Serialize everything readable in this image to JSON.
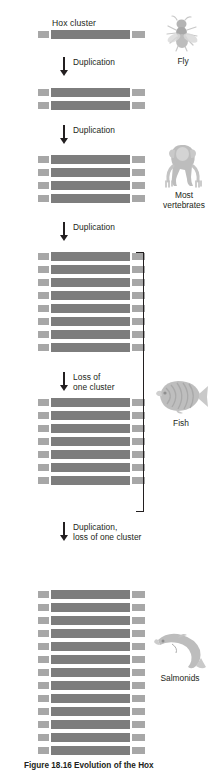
{
  "figure": {
    "title": "Hox cluster",
    "caption": "Figure 18.16  Evolution of the Hox",
    "bar_color": "#7d7d7d",
    "cap_color": "#a7a7a7",
    "ink_color": "#231f20"
  },
  "transitions": [
    {
      "id": "t1",
      "label": "Duplication"
    },
    {
      "id": "t2",
      "label": "Duplication"
    },
    {
      "id": "t3",
      "label": "Duplication"
    },
    {
      "id": "t4",
      "label": "Loss of\none cluster"
    },
    {
      "id": "t5",
      "label": "Duplication,\nloss of one cluster"
    }
  ],
  "stages": [
    {
      "id": "s1",
      "cluster_count": 1,
      "organism": "Fly"
    },
    {
      "id": "s2",
      "cluster_count": 2,
      "organism": ""
    },
    {
      "id": "s3",
      "cluster_count": 4,
      "organism": "Most\nvertebrates"
    },
    {
      "id": "s4",
      "cluster_count": 8,
      "organism": ""
    },
    {
      "id": "s5",
      "cluster_count": 7,
      "organism": "Fish"
    },
    {
      "id": "s6",
      "cluster_count": 13,
      "organism": "Salmonids"
    }
  ],
  "organisms": [
    {
      "id": "fly",
      "icon": "fly-icon",
      "label": "Fly"
    },
    {
      "id": "vertebrate",
      "icon": "monkey-icon",
      "label": "Most\nvertebrates"
    },
    {
      "id": "fish",
      "icon": "fish-icon",
      "label": "Fish"
    },
    {
      "id": "salmonid",
      "icon": "salmon-icon",
      "label": "Salmonids"
    }
  ],
  "bracket": {
    "name": "fish-group-bracket"
  }
}
